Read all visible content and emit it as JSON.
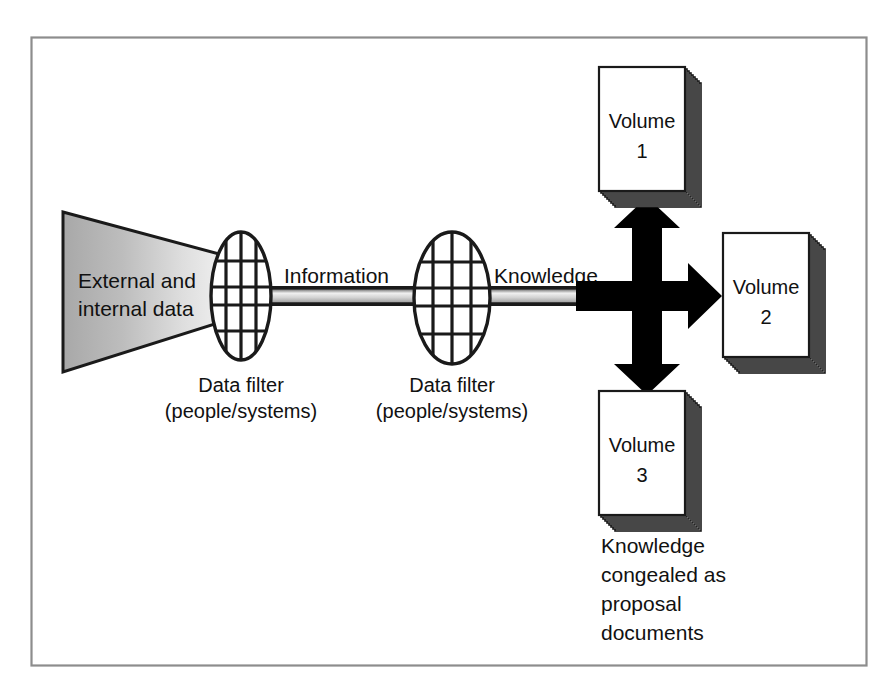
{
  "figure": {
    "name": "knowledge-flow-diagram",
    "frame": {
      "stroke": "#8d8d8d",
      "fill": "#ffffff"
    },
    "ink": "#111111",
    "paper": "#ffffff"
  },
  "source": {
    "name": "external-internal-data-funnel",
    "line1": "External and",
    "line2": "internal data",
    "gradient_from": "#b4b4b4",
    "gradient_to": "#f2f2f2"
  },
  "filters": [
    {
      "name": "data-filter-1",
      "title": "Data filter",
      "subtitle": "(people/systems)"
    },
    {
      "name": "data-filter-2",
      "title": "Data filter",
      "subtitle": "(people/systems)"
    }
  ],
  "flows": [
    {
      "name": "information-pipe",
      "label": "Information"
    },
    {
      "name": "knowledge-pipe",
      "label": "Knowledge"
    }
  ],
  "splitter": {
    "name": "three-way-arrow",
    "directions": [
      "up",
      "right",
      "down"
    ],
    "color": "#000000"
  },
  "documents": [
    {
      "name": "volume-1-stack",
      "line1": "Volume",
      "line2": "1",
      "sheets": 9
    },
    {
      "name": "volume-2-stack",
      "line1": "Volume",
      "line2": "2",
      "sheets": 9
    },
    {
      "name": "volume-3-stack",
      "line1": "Volume",
      "line2": "3",
      "sheets": 9
    }
  ],
  "caption": {
    "name": "knowledge-documents-caption",
    "lines": [
      "Knowledge",
      "congealed as",
      "proposal",
      "documents"
    ],
    "line_0": "Knowledge",
    "line_1": "congealed as",
    "line_2": "proposal",
    "line_3": "documents"
  }
}
